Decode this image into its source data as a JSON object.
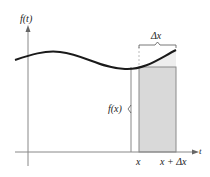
{
  "diagram": {
    "type": "area-under-curve-strip",
    "labels": {
      "y_axis": "f(t)",
      "x_axis": "t",
      "width": "Δx",
      "height": "f(x)",
      "left_point": "x",
      "right_point": "x + Δx"
    },
    "colors": {
      "curve": "#1a1a1a",
      "axis": "#888888",
      "rectangle_fill": "#d9d9d9",
      "rectangle_stroke": "#8a8a8a",
      "excess_fill": "#eeeeee",
      "dashed_line": "#aaaaaa"
    },
    "elements": [
      "curve f(t)",
      "vertical axis f(t)",
      "horizontal axis t",
      "shaded rectangle from x to x + Δx with height f(x)",
      "brace labeled Δx above rectangle",
      "brace labeled f(x) left of rectangle"
    ]
  }
}
